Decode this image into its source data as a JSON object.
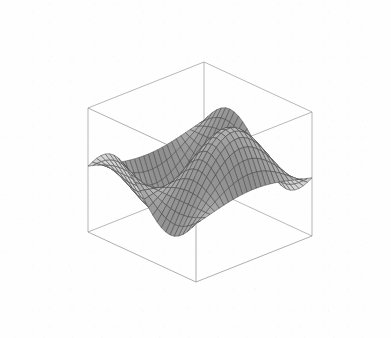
{
  "figure": {
    "kind": "surface-plot-3d",
    "title": "",
    "caption": "",
    "background_color": "#ffffff",
    "width": 391,
    "height": 338
  },
  "chart_data": {
    "type": "surface",
    "title": "",
    "xlabel": "",
    "ylabel": "",
    "zlabel": "",
    "grid": false,
    "legend": false,
    "legend_position": "none",
    "projection": "3d-parallel",
    "view": {
      "azimuth_deg": 42,
      "elevation_deg": 28,
      "description": "default Mathematica Plot3D viewpoint (1.3, -2.4, 2.0)"
    },
    "surface_style": {
      "shading": "grayscale-lambertian",
      "mesh": true,
      "mesh_color": "#4a4a4a",
      "mesh_divisions_u": 25,
      "mesh_divisions_v": 25,
      "fill_light": "#d9d9d9",
      "fill_dark": "#6b6b6b",
      "edge_color": "#3a3a3a"
    },
    "bounding_box": {
      "visible": true,
      "color": "#8c8c8c",
      "tick_labels": [],
      "axis_labels_shown": false
    },
    "xlim": [
      -3,
      3
    ],
    "ylim": [
      -3,
      3
    ],
    "zlim": [
      -1.1,
      1.1
    ],
    "function": "z = sin(x) * cos(y/1.45)",
    "x_samples": 26,
    "y_samples": 26,
    "annotations": []
  },
  "projection_params": {
    "screen_origin_x": 200,
    "screen_origin_y": 172,
    "ex_x": 54.0,
    "ex_y": 25.0,
    "ey_x": -58.0,
    "ey_y": 23.0,
    "ez_y": -62.0
  }
}
